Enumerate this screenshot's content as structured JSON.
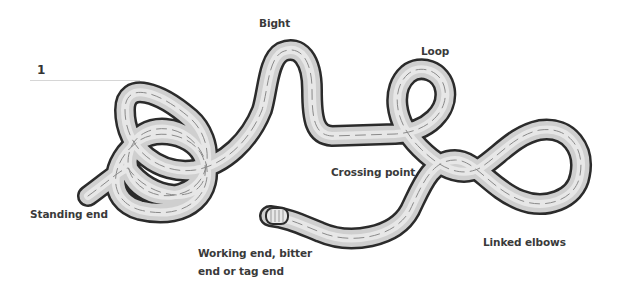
{
  "figure": {
    "number": "1"
  },
  "labels": {
    "bight": "Bight",
    "loop": "Loop",
    "crossing_point": "Crossing point",
    "standing_end": "Standing end",
    "working_end_line1": "Working end, bitter",
    "working_end_line2": "end or tag end",
    "linked_elbows": "Linked elbows"
  },
  "colors": {
    "rope_outline": "#2b2b2b",
    "rope_fill_light": "#f2f2f2",
    "rope_fill_dark": "#a9a9a9",
    "rope_strand": "#8a8a8a",
    "label_text": "#3a3a3a",
    "leader_line": "#d6d6d6"
  }
}
